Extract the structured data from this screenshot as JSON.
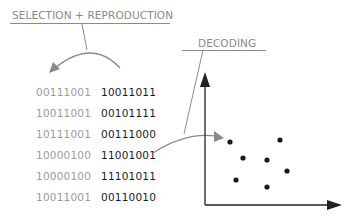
{
  "diagram": {
    "labels": {
      "selection": "SELECTION + REPRODUCTION",
      "decoding": "DECODING"
    },
    "population": [
      {
        "parent": "00111001",
        "child": "10011011"
      },
      {
        "parent": "10011001",
        "child": "00101111"
      },
      {
        "parent": "10111001",
        "child": "00111000"
      },
      {
        "parent": "10000100",
        "child": "11001001"
      },
      {
        "parent": "10000100",
        "child": "11101011"
      },
      {
        "parent": "10011001",
        "child": "00110010"
      }
    ],
    "scatter_points": [
      {
        "x": 230,
        "y": 142
      },
      {
        "x": 280,
        "y": 140
      },
      {
        "x": 243,
        "y": 158
      },
      {
        "x": 267,
        "y": 160
      },
      {
        "x": 287,
        "y": 171
      },
      {
        "x": 236,
        "y": 180
      },
      {
        "x": 267,
        "y": 187
      }
    ],
    "colors": {
      "label": "#8a8a8a",
      "parent_text": "#9a9a9a",
      "child_text": "#1a1a1a",
      "axes": "#222222",
      "arrows": "#8a8a8a",
      "points": "#1a1a1a"
    }
  }
}
